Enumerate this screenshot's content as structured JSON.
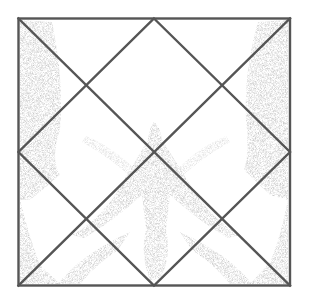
{
  "figure": {
    "colors": {
      "background": "#ffffff",
      "line": "#555555",
      "stipple": "#bdbdbd",
      "stipple_dark": "#9a9a9a"
    },
    "square": {
      "x1": 18,
      "y1": 18,
      "x2": 290,
      "y2": 286
    },
    "center": {
      "x": 154,
      "y": 152
    }
  }
}
